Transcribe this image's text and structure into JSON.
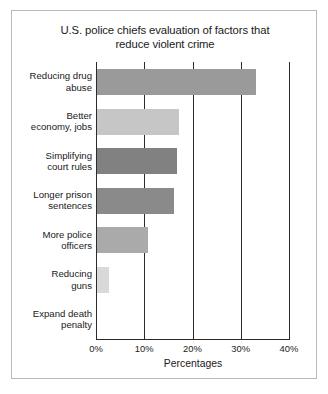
{
  "chart_data": {
    "type": "bar",
    "orientation": "horizontal",
    "title": "U.S. police chiefs evaluation of factors that reduce violent crime",
    "title_lines": [
      "U.S. police chiefs evaluation of factors that",
      "reduce violent crime"
    ],
    "xlabel": "Percentages",
    "ylabel": "",
    "xlim": [
      0,
      40
    ],
    "xticks": [
      0,
      10,
      20,
      30,
      40
    ],
    "xtick_labels": [
      "0%",
      "10%",
      "20%",
      "30%",
      "40%"
    ],
    "grid": "vertical",
    "legend": "none",
    "categories": [
      "Reducing drug abuse",
      "Better economy, jobs",
      "Simplifying court rules",
      "Longer prison sentences",
      "More police officers",
      "Reducing guns",
      "Expand death penalty"
    ],
    "category_lines": [
      [
        "Reducing drug",
        "abuse"
      ],
      [
        "Better",
        "economy, jobs"
      ],
      [
        "Simplifying",
        "court rules"
      ],
      [
        "Longer prison",
        "sentences"
      ],
      [
        "More police",
        "officers"
      ],
      [
        "Reducing",
        "guns"
      ],
      [
        "Expand death",
        "penalty"
      ]
    ],
    "values": [
      33,
      17,
      16.5,
      16,
      10.5,
      2.5,
      0
    ],
    "bar_colors": [
      "#9a9a9a",
      "#c6c6c6",
      "#818181",
      "#8a8a8a",
      "#aaaaaa",
      "#d9d9d9",
      "#ffffff"
    ]
  },
  "style": {
    "frame_border": "#b9b9b9",
    "axis_color": "#2b2b2b",
    "text_color": "#1a1a1a",
    "background": "#ffffff"
  }
}
